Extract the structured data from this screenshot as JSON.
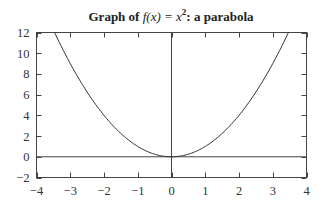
{
  "chart_data": {
    "type": "line",
    "title_parts": {
      "prefix": "Graph of ",
      "func": "f",
      "paren_open": "(",
      "var": "x",
      "paren_close": ")",
      "eq": " = ",
      "base": "x",
      "exp": "2",
      "suffix": ": a parabola"
    },
    "xlabel": "",
    "ylabel": "",
    "xlim": [
      -4,
      4
    ],
    "ylim": [
      -2,
      12
    ],
    "xticks": [
      -4,
      -3,
      -2,
      -1,
      0,
      1,
      2,
      3,
      4
    ],
    "xtick_labels": [
      "−4",
      "−3",
      "−2",
      "−1",
      "0",
      "1",
      "2",
      "3",
      "4"
    ],
    "yticks": [
      -2,
      0,
      2,
      4,
      6,
      8,
      10,
      12
    ],
    "ytick_labels": [
      "−2",
      "0",
      "2",
      "4",
      "6",
      "8",
      "10",
      "12"
    ],
    "grid": false,
    "zero_lines": true,
    "series": [
      {
        "name": "f(x) = x^2",
        "x": [
          -4,
          -3.5,
          -3,
          -2.5,
          -2,
          -1.5,
          -1,
          -0.5,
          0,
          0.5,
          1,
          1.5,
          2,
          2.5,
          3,
          3.5,
          4
        ],
        "values": [
          16,
          12.25,
          9,
          6.25,
          4,
          2.25,
          1,
          0.25,
          0,
          0.25,
          1,
          2.25,
          4,
          6.25,
          9,
          12.25,
          16
        ]
      }
    ],
    "colors": {
      "line": "#333333",
      "axes": "#444444"
    }
  }
}
